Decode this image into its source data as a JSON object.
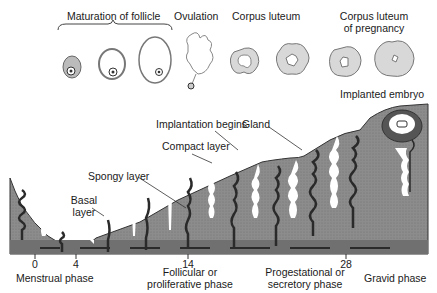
{
  "ovary": {
    "maturation_label": "Maturation of follicle",
    "ovulation_label": "Ovulation",
    "corpus_luteum_label": "Corpus luteum",
    "corpus_luteum_pregnancy_label_line1": "Corpus luteum",
    "corpus_luteum_pregnancy_label_line2": "of pregnancy"
  },
  "endometrium": {
    "implanted_embryo_label": "Implanted embryo",
    "implantation_begins_label": "Implantation begins",
    "gland_label": "Gland",
    "compact_layer_label": "Compact layer",
    "spongy_layer_label": "Spongy layer",
    "basal_layer_label_line1": "Basal",
    "basal_layer_label_line2": "layer"
  },
  "axis": {
    "ticks": [
      "0",
      "4",
      "14",
      "28"
    ]
  },
  "phases": {
    "menstrual": "Menstrual phase",
    "follicular_line1": "Follicular or",
    "follicular_line2": "proliferative phase",
    "progestational_line1": "Progestational or",
    "progestational_line2": "secretory phase",
    "gravid": "Gravid phase"
  },
  "colors": {
    "tissue": "#8a8a8a",
    "basal": "#6e6e6e",
    "gland": "#2a2a2a",
    "ovary_fill": "#d8d8d8"
  }
}
